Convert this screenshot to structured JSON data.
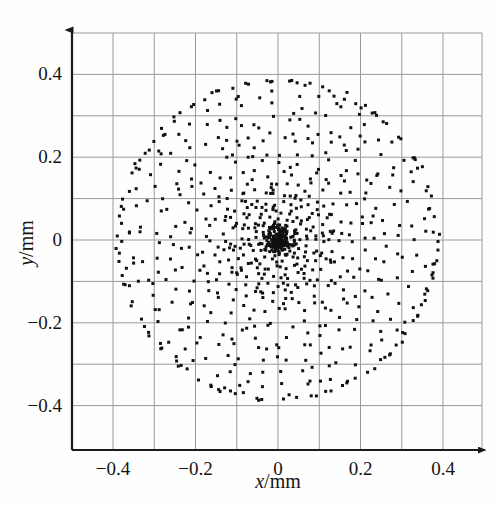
{
  "figure": {
    "kind": "spot-diagram",
    "background_color": "#fefefe",
    "point_color": "#111111",
    "grid_color": "#9a9a9a",
    "axis_color": "#1a1a1a"
  },
  "axes": {
    "x_title_var": "x",
    "x_title_unit": "/mm",
    "y_title_var": "y",
    "y_title_unit": "/mm",
    "x_major_ticks": [
      "−0.4",
      "−0.2",
      "0",
      "0.2",
      "0.4"
    ],
    "x_major_values": [
      -0.4,
      -0.2,
      0,
      0.2,
      0.4
    ],
    "y_major_ticks": [
      "0.4",
      "0.2",
      "0",
      "−0.2",
      "−0.4"
    ],
    "y_major_values": [
      0.4,
      0.2,
      0,
      -0.2,
      -0.4
    ],
    "minor_step": 0.1
  },
  "chart_data": {
    "type": "scatter",
    "title": "",
    "xlabel": "x/mm",
    "ylabel": "y/mm",
    "xlim": [
      -0.5,
      0.46
    ],
    "ylim": [
      -0.48,
      0.46
    ],
    "grid": true,
    "grid_step": 0.1,
    "legend": null,
    "x_tick_labels": [
      "−0.4",
      "−0.2",
      "0",
      "0.2",
      "0.4"
    ],
    "x_tick_values": [
      -0.4,
      -0.2,
      0,
      0.2,
      0.4
    ],
    "y_tick_labels": [
      "0.4",
      "0.2",
      "0",
      "−0.2",
      "−0.4"
    ],
    "y_tick_values": [
      0.4,
      0.2,
      0,
      -0.2,
      -0.4
    ],
    "marker": "square",
    "marker_size_px": 3,
    "marker_color": "#111111",
    "series": [
      {
        "name": "ray intersections",
        "description": "Optical spot diagram: rays traced through a circular pupil, arranged in concentric rings with radial spokes; dense central core, bounded by a circle of radius about 0.39 mm.",
        "point_count": 744,
        "pattern": {
          "model": "polar-rings",
          "radius_max_mm": 0.39,
          "ring_count": 18,
          "spokes_per_ring_base": 8,
          "spoke_growth": 3,
          "core_cluster_radius_mm": 0.045,
          "core_cluster_points": 150,
          "radius_exponent": 1.55,
          "angle_jitter_rad": 0.085,
          "radius_jitter_mm": 0.011,
          "seed": 20240517
        },
        "x_range_mm": [
          -0.39,
          0.39
        ],
        "y_range_mm": [
          -0.385,
          0.385
        ],
        "centroid_mm": [
          0.0,
          0.0
        ],
        "rms_radius_mm": 0.22
      }
    ]
  },
  "geometry": {
    "plot_left_px": 72,
    "plot_right_px": 482,
    "plot_top_px": 33,
    "plot_bottom_px": 450,
    "origin_x_px": 278,
    "origin_y_px": 240,
    "px_per_unit_x": 412.5,
    "px_per_unit_y": 414.0
  }
}
